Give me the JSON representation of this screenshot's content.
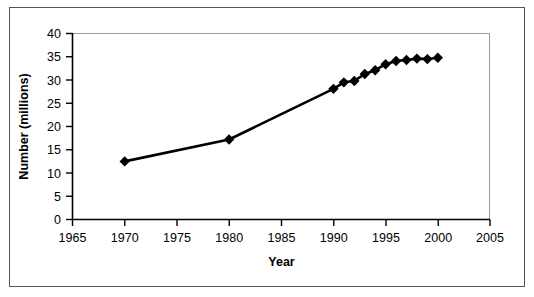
{
  "chart_data": {
    "type": "line",
    "title": "",
    "subtitle": "",
    "xlabel": "Year",
    "ylabel": "Number (millions)",
    "xlim": [
      1965,
      2005
    ],
    "ylim": [
      0,
      40
    ],
    "xticks": [
      1965,
      1970,
      1975,
      1980,
      1985,
      1990,
      1995,
      2000,
      2005
    ],
    "yticks": [
      0,
      5,
      10,
      15,
      20,
      25,
      30,
      35,
      40
    ],
    "xtick_labels": [
      "1965",
      "1970",
      "1975",
      "1980",
      "1985",
      "1990",
      "1995",
      "2000",
      "2005"
    ],
    "ytick_labels": [
      "0",
      "5",
      "10",
      "15",
      "20",
      "25",
      "30",
      "35",
      "40"
    ],
    "grid": false,
    "legend": false,
    "legend_position": "none",
    "marker": "diamond",
    "marker_color": "#000000",
    "line_color": "#000000",
    "series": [
      {
        "name": "Number (millions)",
        "x": [
          1970,
          1980,
          1990,
          1991,
          1992,
          1993,
          1994,
          1995,
          1996,
          1997,
          1998,
          1999,
          2000
        ],
        "values": [
          12.5,
          17.2,
          28.1,
          29.5,
          29.8,
          31.3,
          32.1,
          33.4,
          34.1,
          34.3,
          34.6,
          34.5,
          34.8
        ]
      }
    ]
  },
  "axes": {
    "x_title": "Year",
    "y_title": "Number (millions)"
  },
  "colors": {
    "line": "#000000",
    "marker": "#000000",
    "plot_border": "#9a9a9a",
    "axis": "#000000",
    "outer_border": "#555555",
    "background": "#ffffff"
  }
}
